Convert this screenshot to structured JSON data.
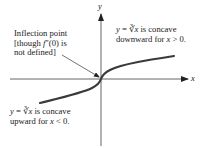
{
  "axes": {
    "x_label": "x",
    "y_label": "y"
  },
  "annotations": {
    "inflection": {
      "line1": "Inflection point",
      "line2_pre": "[though ",
      "line2_f": "f",
      "line2_post": "″(0) is",
      "line3": "not defined]"
    },
    "right": {
      "y": "y",
      "eq": " = ",
      "root": "∛x",
      "line1_post": " is concave",
      "line2_pre": "downward for ",
      "var": "x",
      "line2_post": " > 0."
    },
    "left": {
      "y": "y",
      "eq": " = ",
      "root": "∛x",
      "line1_post": " is concave",
      "line2_pre": "upward for ",
      "var": "x",
      "line2_post": " < 0."
    }
  },
  "colors": {
    "curve": "#3a3a3a",
    "axis": "#444444",
    "text": "#1a1a1a"
  }
}
